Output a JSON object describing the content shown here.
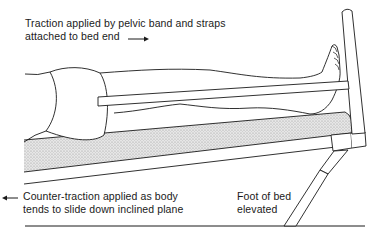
{
  "figure": {
    "labels": {
      "traction": {
        "lines": [
          "Traction applied by pelvic band and straps",
          "attached to bed end"
        ],
        "arrow": "right-arrow"
      },
      "counter_traction": {
        "lines": [
          "Counter-traction applied as body",
          "tends to slide down inclined plane"
        ],
        "arrow": "left-arrow"
      },
      "foot_of_bed": {
        "lines": [
          "Foot of bed",
          "elevated"
        ]
      }
    },
    "parts": [
      "patient-legs",
      "pelvic-band",
      "traction-strap",
      "mattress",
      "bed-frame",
      "bed-end-post",
      "bed-leg-support",
      "floor-line"
    ],
    "colors": {
      "ink": "#1a1a1a",
      "mattress_fill": "#d9d9d9",
      "background": "#ffffff"
    }
  }
}
